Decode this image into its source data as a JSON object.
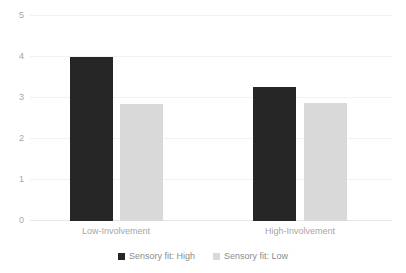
{
  "chart_data": {
    "type": "bar",
    "title": "",
    "subtitle": "",
    "xlabel": "",
    "ylabel": "",
    "categories": [
      "Low-Involvement",
      "High-Involvement"
    ],
    "series": [
      {
        "name": "Sensory fit: High",
        "color": "#262626",
        "values": [
          4.0,
          3.27
        ]
      },
      {
        "name": "Sensory fit: Low",
        "color": "#d9d9d9",
        "values": [
          2.85,
          2.88
        ]
      }
    ],
    "ylim": [
      0,
      5
    ],
    "yticks": [
      0,
      1,
      2,
      3,
      4,
      5
    ],
    "ytick_labels": [
      "0",
      "1",
      "2",
      "3",
      "4",
      "5"
    ],
    "grid": true,
    "grid_axis": "y",
    "grid_color": "#f2f2f2",
    "legend": true,
    "legend_position": "bottom",
    "tick_label_color": "#a6a6a6",
    "background": "#ffffff"
  },
  "legend": {
    "items": [
      {
        "label": "Sensory fit: High",
        "swatch": "legend-swatch-high"
      },
      {
        "label": "Sensory fit: Low",
        "swatch": "legend-swatch-low"
      }
    ]
  },
  "axis": {
    "y_labels": [
      "5",
      "4",
      "3",
      "2",
      "1",
      "0"
    ]
  },
  "categories": {
    "c0": "Low-Involvement",
    "c1": "High-Involvement"
  }
}
